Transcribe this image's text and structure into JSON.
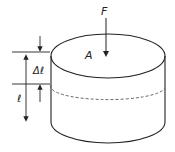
{
  "diagram": {
    "type": "physics-compression-cylinder",
    "labels": {
      "force": "F",
      "area": "A",
      "delta_length": "Δℓ",
      "length": "ℓ"
    },
    "colors": {
      "stroke": "#222222",
      "dashed": "#555555",
      "background": "#ffffff"
    }
  }
}
